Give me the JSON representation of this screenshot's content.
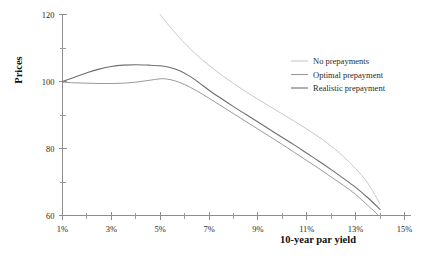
{
  "chart_data": {
    "type": "line",
    "title": "",
    "xlabel": "10-year par yield",
    "ylabel": "Prices",
    "xlim": [
      1,
      15
    ],
    "ylim": [
      60,
      120
    ],
    "grid": false,
    "legend_position": "right-top",
    "x_tick_labels": [
      "1%",
      "3%",
      "5%",
      "7%",
      "9%",
      "11%",
      "13%",
      "15%"
    ],
    "x_tick_values": [
      1,
      3,
      5,
      7,
      9,
      11,
      13,
      15
    ],
    "x_minor_tick_values": [
      2,
      4,
      6,
      8,
      10,
      12,
      14
    ],
    "y_tick_labels": [
      "60",
      "80",
      "100",
      "120"
    ],
    "y_tick_values": [
      60,
      80,
      100,
      120
    ],
    "y_minor_tick_values": [
      70,
      90,
      110
    ],
    "series": [
      {
        "name": "No prepayments",
        "color": "#c9c9c9",
        "width": 1.0,
        "x": [
          5.0,
          5.3,
          5.7,
          6.1,
          6.5,
          7.0,
          7.5,
          8.0,
          8.5,
          9.0,
          9.5,
          10.0,
          10.5,
          11.0,
          11.5,
          12.0,
          12.5,
          13.0,
          13.5,
          14.0
        ],
        "y": [
          120.0,
          117.2,
          113.8,
          110.7,
          107.9,
          104.8,
          102.0,
          99.4,
          97.0,
          94.7,
          92.5,
          90.3,
          88.1,
          85.8,
          83.4,
          80.7,
          77.6,
          74.0,
          69.6,
          63.5
        ]
      },
      {
        "name": "Optimal prepayment",
        "color": "#9a9a9a",
        "width": 1.0,
        "x": [
          1.0,
          1.5,
          2.0,
          2.5,
          3.0,
          3.5,
          4.0,
          4.5,
          5.0,
          5.3,
          5.6,
          6.0,
          6.5,
          7.0,
          7.5,
          8.0,
          8.5,
          9.0,
          9.5,
          10.0,
          10.5,
          11.0,
          11.5,
          12.0,
          12.5,
          13.0,
          13.5,
          13.9
        ],
        "y": [
          99.8,
          99.6,
          99.5,
          99.4,
          99.4,
          99.5,
          99.8,
          100.3,
          100.8,
          100.7,
          100.2,
          99.1,
          97.2,
          95.0,
          92.7,
          90.4,
          88.1,
          85.8,
          83.5,
          81.2,
          78.8,
          76.4,
          74.0,
          71.5,
          69.0,
          66.3,
          63.0,
          60.3
        ]
      },
      {
        "name": "Realistic prepayment",
        "color": "#6e6e6e",
        "width": 1.1,
        "x": [
          1.0,
          1.5,
          2.0,
          2.5,
          3.0,
          3.5,
          4.0,
          4.5,
          5.0,
          5.4,
          5.8,
          6.2,
          6.6,
          7.0,
          7.5,
          8.0,
          8.5,
          9.0,
          9.5,
          10.0,
          10.5,
          11.0,
          11.5,
          12.0,
          12.5,
          13.0,
          13.5,
          14.0
        ],
        "y": [
          100.0,
          101.3,
          102.6,
          103.7,
          104.5,
          104.9,
          105.0,
          104.9,
          104.7,
          104.2,
          103.2,
          101.6,
          99.6,
          97.4,
          94.9,
          92.5,
          90.2,
          87.9,
          85.6,
          83.3,
          81.0,
          78.6,
          76.2,
          73.7,
          71.1,
          68.4,
          65.3,
          61.8
        ]
      }
    ]
  },
  "legend": {
    "items": [
      {
        "label": "No prepayments"
      },
      {
        "label": "Optimal prepayment"
      },
      {
        "label": "Realistic prepayment"
      }
    ]
  },
  "colors": {
    "axis": "#8d8d8d",
    "text": "#2b2b2b",
    "background": "#ffffff"
  }
}
